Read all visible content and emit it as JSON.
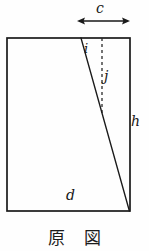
{
  "figure": {
    "caption": "原 図",
    "caption_meaning": "original figure",
    "background_color": "#fefefe",
    "ink_color": "#1a1a1a",
    "labels": {
      "c": "c",
      "i": "i",
      "j": "j",
      "h": "h",
      "d": "d"
    },
    "geometry": {
      "rectangle": {
        "left": 7,
        "top": 38,
        "right": 130,
        "bottom": 211,
        "width": 123,
        "height": 173,
        "stroke_width": 1.6
      },
      "diagonal_line": {
        "name": "slanted-cut-line",
        "x1": 81,
        "y1": 38,
        "x2": 129,
        "y2": 211,
        "stroke_width": 1.3
      },
      "dashed_line": {
        "name": "vertical-dashed-reference-line",
        "x1": 102,
        "y1": 38,
        "x2": 102,
        "y2": 113,
        "stroke_width": 1.2,
        "dash_pattern": "3 3"
      },
      "dimension_arrow_c": {
        "name": "c-dimension-arrow",
        "x1": 77,
        "x2": 130,
        "y": 21,
        "stroke_width": 1.3,
        "double_headed": true
      }
    }
  }
}
